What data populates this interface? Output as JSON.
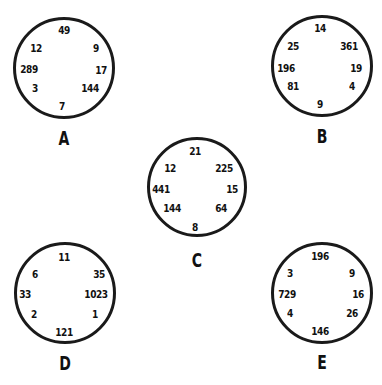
{
  "puzzles": [
    {
      "label": "A",
      "cx": 64,
      "cy": 68,
      "r": 51,
      "lx": 64,
      "ly": 138,
      "numbers": [
        {
          "value": "49",
          "x": 64,
          "y": 30
        },
        {
          "value": "9",
          "x": 96,
          "y": 48
        },
        {
          "value": "17",
          "x": 101,
          "y": 70
        },
        {
          "value": "144",
          "x": 90,
          "y": 88
        },
        {
          "value": "7",
          "x": 62,
          "y": 106
        },
        {
          "value": "3",
          "x": 35,
          "y": 88
        },
        {
          "value": "289",
          "x": 29,
          "y": 69
        },
        {
          "value": "12",
          "x": 36,
          "y": 48
        }
      ]
    },
    {
      "label": "B",
      "cx": 322,
      "cy": 66,
      "r": 51,
      "lx": 322,
      "ly": 136,
      "numbers": [
        {
          "value": "14",
          "x": 320,
          "y": 28
        },
        {
          "value": "361",
          "x": 349,
          "y": 46
        },
        {
          "value": "19",
          "x": 356,
          "y": 68
        },
        {
          "value": "4",
          "x": 352,
          "y": 86
        },
        {
          "value": "9",
          "x": 320,
          "y": 104
        },
        {
          "value": "81",
          "x": 293,
          "y": 86
        },
        {
          "value": "196",
          "x": 286,
          "y": 68
        },
        {
          "value": "25",
          "x": 293,
          "y": 46
        }
      ]
    },
    {
      "label": "C",
      "cx": 197,
      "cy": 187,
      "r": 50,
      "lx": 197,
      "ly": 260,
      "numbers": [
        {
          "value": "21",
          "x": 195,
          "y": 151
        },
        {
          "value": "225",
          "x": 224,
          "y": 168
        },
        {
          "value": "15",
          "x": 232,
          "y": 189
        },
        {
          "value": "64",
          "x": 221,
          "y": 208
        },
        {
          "value": "8",
          "x": 195,
          "y": 227
        },
        {
          "value": "144",
          "x": 172,
          "y": 208
        },
        {
          "value": "441",
          "x": 161,
          "y": 189
        },
        {
          "value": "12",
          "x": 170,
          "y": 168
        }
      ]
    },
    {
      "label": "D",
      "cx": 65,
      "cy": 293,
      "r": 51,
      "lx": 65,
      "ly": 363,
      "numbers": [
        {
          "value": "11",
          "x": 64,
          "y": 257
        },
        {
          "value": "35",
          "x": 99,
          "y": 274
        },
        {
          "value": "1023",
          "x": 96,
          "y": 294
        },
        {
          "value": "1",
          "x": 95,
          "y": 314
        },
        {
          "value": "121",
          "x": 64,
          "y": 332
        },
        {
          "value": "2",
          "x": 34,
          "y": 314
        },
        {
          "value": "33",
          "x": 25,
          "y": 294
        },
        {
          "value": "6",
          "x": 35,
          "y": 274
        }
      ]
    },
    {
      "label": "E",
      "cx": 322,
      "cy": 293,
      "r": 51,
      "lx": 322,
      "ly": 362,
      "numbers": [
        {
          "value": "196",
          "x": 320,
          "y": 256
        },
        {
          "value": "9",
          "x": 352,
          "y": 273
        },
        {
          "value": "16",
          "x": 358,
          "y": 294
        },
        {
          "value": "26",
          "x": 352,
          "y": 313
        },
        {
          "value": "146",
          "x": 320,
          "y": 331
        },
        {
          "value": "4",
          "x": 290,
          "y": 313
        },
        {
          "value": "729",
          "x": 287,
          "y": 294
        },
        {
          "value": "3",
          "x": 290,
          "y": 273
        }
      ]
    }
  ]
}
